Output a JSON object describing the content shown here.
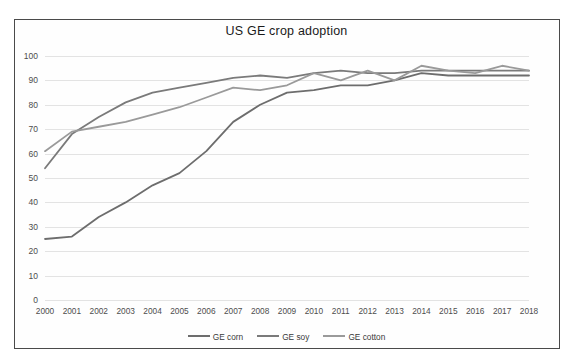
{
  "chart_data": {
    "type": "line",
    "title": "US GE crop adoption",
    "xlabel": "",
    "ylabel": "",
    "ylim": [
      0,
      100
    ],
    "yticks": [
      0,
      10,
      20,
      30,
      40,
      50,
      60,
      70,
      80,
      90,
      100
    ],
    "grid": true,
    "legend_position": "bottom",
    "x": [
      2000,
      2001,
      2002,
      2003,
      2004,
      2005,
      2006,
      2007,
      2008,
      2009,
      2010,
      2011,
      2012,
      2013,
      2014,
      2015,
      2016,
      2017,
      2018
    ],
    "categories": [
      "2000",
      "2001",
      "2002",
      "2003",
      "2004",
      "2005",
      "2006",
      "2007",
      "2008",
      "2009",
      "2010",
      "2011",
      "2012",
      "2013",
      "2014",
      "2015",
      "2016",
      "2017",
      "2018"
    ],
    "series": [
      {
        "name": "GE corn",
        "color": "#6d6d6d",
        "values": [
          25,
          26,
          34,
          40,
          47,
          52,
          61,
          73,
          80,
          85,
          86,
          88,
          88,
          90,
          93,
          92,
          92,
          92,
          92
        ]
      },
      {
        "name": "GE soy",
        "color": "#7a7a7a",
        "values": [
          54,
          68,
          75,
          81,
          85,
          87,
          89,
          91,
          92,
          91,
          93,
          94,
          93,
          93,
          94,
          94,
          94,
          94,
          94
        ]
      },
      {
        "name": "GE cotton",
        "color": "#9a9a9a",
        "values": [
          61,
          69,
          71,
          73,
          76,
          79,
          83,
          87,
          86,
          88,
          93,
          90,
          94,
          90,
          96,
          94,
          93,
          96,
          94
        ]
      }
    ]
  },
  "legend": {
    "entries": [
      {
        "label": "GE corn"
      },
      {
        "label": "GE soy"
      },
      {
        "label": "GE cotton"
      }
    ]
  },
  "colors": {
    "frame_border": "#4a4a4a",
    "gridline": "#e3e3e3",
    "background": "#ffffff",
    "tick_text": "#4d4d4d",
    "title_text": "#1a1a1a"
  }
}
